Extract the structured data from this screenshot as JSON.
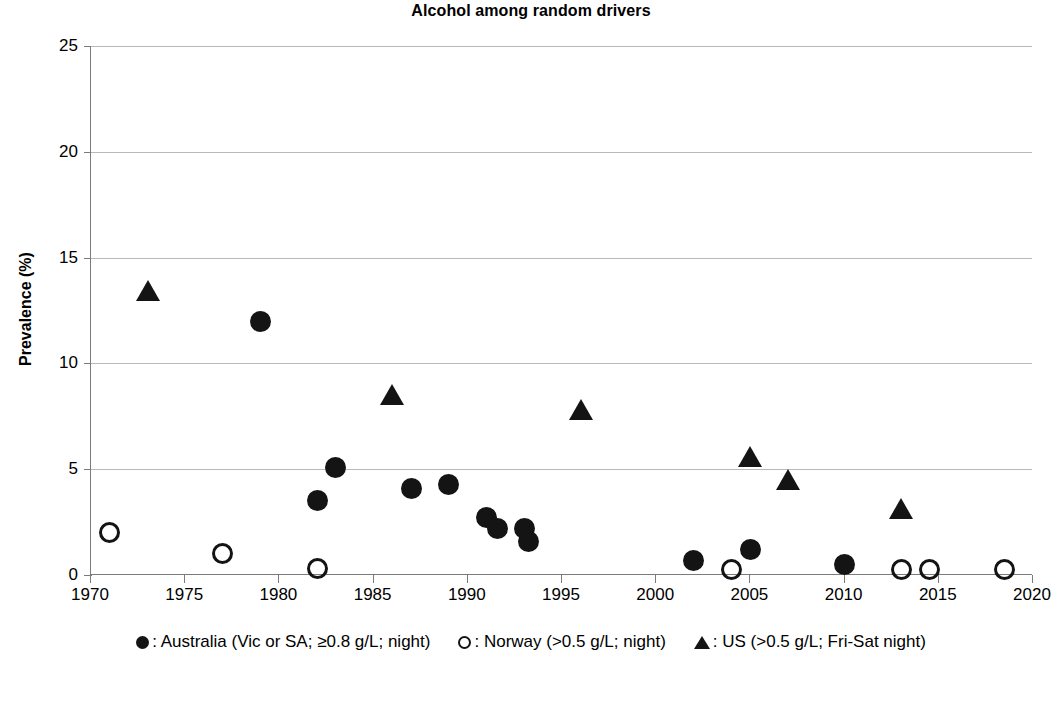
{
  "chart_data": {
    "type": "scatter",
    "title": "Alcohol among random drivers",
    "xlabel": "",
    "ylabel": "Prevalence (%)",
    "xlim": [
      1970,
      2020
    ],
    "ylim": [
      0,
      25
    ],
    "xticks": [
      1970,
      1975,
      1980,
      1985,
      1990,
      1995,
      2000,
      2005,
      2010,
      2015,
      2020
    ],
    "yticks": [
      0,
      5,
      10,
      15,
      20,
      25
    ],
    "grid": "horizontal",
    "legend_position": "bottom",
    "series": [
      {
        "name": "Australia (Vic or SA; ≥0.8 g/L; night)",
        "marker": "circle-filled",
        "color": "#141414",
        "points": [
          {
            "x": 1979,
            "y": 12.0
          },
          {
            "x": 1982,
            "y": 3.5
          },
          {
            "x": 1983,
            "y": 5.1
          },
          {
            "x": 1987,
            "y": 4.1
          },
          {
            "x": 1989,
            "y": 4.3
          },
          {
            "x": 1991,
            "y": 2.7
          },
          {
            "x": 1991.6,
            "y": 2.2
          },
          {
            "x": 1993,
            "y": 2.2
          },
          {
            "x": 1993.2,
            "y": 1.6
          },
          {
            "x": 2002,
            "y": 0.7
          },
          {
            "x": 2005,
            "y": 1.2
          },
          {
            "x": 2010,
            "y": 0.5
          }
        ]
      },
      {
        "name": "Norway (>0.5 g/L; night)",
        "marker": "circle-open",
        "color": "#141414",
        "points": [
          {
            "x": 1971,
            "y": 2.0
          },
          {
            "x": 1977,
            "y": 1.0
          },
          {
            "x": 1982,
            "y": 0.3
          },
          {
            "x": 2004,
            "y": 0.25
          },
          {
            "x": 2013,
            "y": 0.25
          },
          {
            "x": 2014.5,
            "y": 0.25
          },
          {
            "x": 2018.5,
            "y": 0.25
          }
        ]
      },
      {
        "name": "US (>0.5 g/L; Fri-Sat night)",
        "marker": "triangle",
        "color": "#141414",
        "points": [
          {
            "x": 1973,
            "y": 13.4
          },
          {
            "x": 1986,
            "y": 8.5
          },
          {
            "x": 1996,
            "y": 7.8
          },
          {
            "x": 2005,
            "y": 5.6
          },
          {
            "x": 2007,
            "y": 4.5
          },
          {
            "x": 2013,
            "y": 3.1
          }
        ]
      }
    ]
  },
  "legend": {
    "items": [
      {
        "label": ": Australia (Vic or SA; ≥0.8 g/L; night)",
        "marker": "circle-filled"
      },
      {
        "label": ": Norway (>0.5 g/L; night)",
        "marker": "circle-open"
      },
      {
        "label": ": US (>0.5 g/L; Fri-Sat night)",
        "marker": "triangle"
      }
    ]
  }
}
